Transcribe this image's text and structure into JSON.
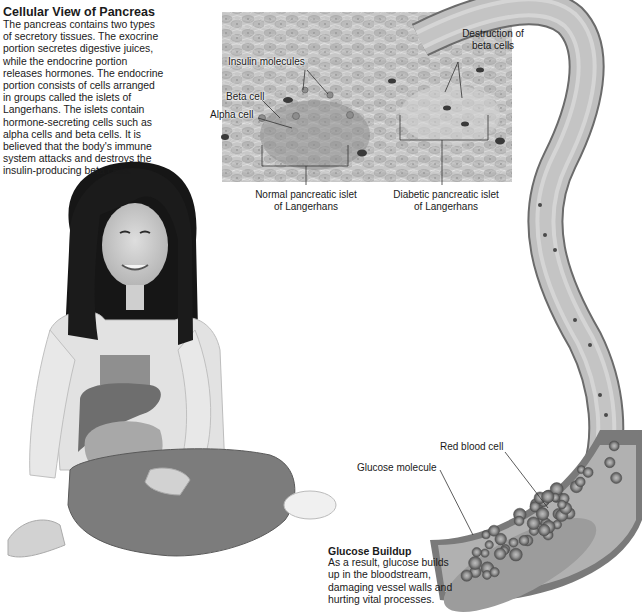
{
  "cellular_view": {
    "title": "Cellular View of Pancreas",
    "lines": [
      "The pancreas contains two types",
      "of secretory tissues. The exocrine",
      "portion secretes digestive juices,",
      "while the endocrine portion",
      "releases hormones. The endocrine",
      "portion consists of cells arranged",
      "in groups called the islets of",
      "Langerhans. The islets contain",
      "hormone-secreting cells such as",
      "alpha cells and beta cells. It is",
      "believed that the body's immune",
      "system attacks and destroys the",
      "insulin-producing beta cells."
    ]
  },
  "labels": {
    "insulin_molecules": "Insulin molecules",
    "beta_cell": "Beta cell",
    "alpha_cell": "Alpha cell",
    "destruction_line1": "Destruction of",
    "destruction_line2": "beta cells",
    "normal_islet_line1": "Normal pancreatic islet",
    "normal_islet_line2": "of Langerhans",
    "diabetic_islet_line1": "Diabetic pancreatic islet",
    "diabetic_islet_line2": "of Langerhans",
    "red_blood_cell": "Red blood cell",
    "glucose_molecule": "Glucose molecule"
  },
  "glucose_buildup": {
    "title": "Glucose Buildup",
    "lines": [
      "As a result, glucose builds",
      "up in the bloodstream,",
      "damaging vessel walls and",
      "hurting vital processes."
    ]
  }
}
